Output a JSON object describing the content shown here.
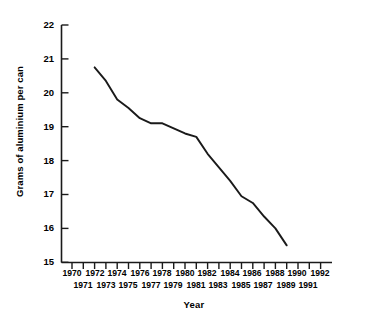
{
  "chart_data": {
    "type": "line",
    "title": "",
    "xlabel": "Year",
    "ylabel": "Grams of aluminium per can",
    "xlim": [
      1970,
      1992
    ],
    "ylim": [
      15,
      22
    ],
    "grid": false,
    "legend": "none",
    "x_tick_labels": [
      "1970",
      "1971",
      "1972",
      "1973",
      "1974",
      "1975",
      "1976",
      "1977",
      "1978",
      "1979",
      "1980",
      "1981",
      "1982",
      "1983",
      "1984",
      "1985",
      "1986",
      "1987",
      "1988",
      "1989",
      "1990",
      "1991",
      "1992"
    ],
    "y_tick_labels": [
      "15",
      "16",
      "17",
      "18",
      "19",
      "20",
      "21",
      "22"
    ],
    "series": [
      {
        "name": "Grams of aluminium per can",
        "color": "#1a1a1a",
        "x": [
          1972,
          1973,
          1974,
          1975,
          1976,
          1977,
          1978,
          1979,
          1980,
          1981,
          1982,
          1983,
          1984,
          1985,
          1986,
          1987,
          1988,
          1989
        ],
        "values": [
          20.75,
          20.35,
          19.8,
          19.55,
          19.25,
          19.1,
          19.1,
          18.95,
          18.8,
          18.7,
          18.2,
          17.8,
          17.4,
          16.95,
          16.75,
          16.35,
          16.0,
          15.5
        ]
      }
    ]
  },
  "axes": {
    "y_title": "Grams of aluminium per can",
    "x_title": "Year"
  }
}
